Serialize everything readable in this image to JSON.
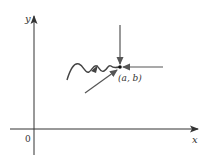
{
  "diagram": {
    "y_axis_label": "y",
    "x_axis_label": "x",
    "origin_label": "0",
    "point_label": "(a, b)",
    "colors": {
      "axis": "#333333",
      "arrow": "#555555",
      "point": "#111111",
      "background": "#ffffff"
    },
    "paths_description": [
      "vertical arrow from above approaching (a, b)",
      "horizontal arrow from the right approaching (a, b)",
      "diagonal arrow from lower-left approaching (a, b)",
      "wavy curve from the left approaching (a, b)"
    ]
  }
}
